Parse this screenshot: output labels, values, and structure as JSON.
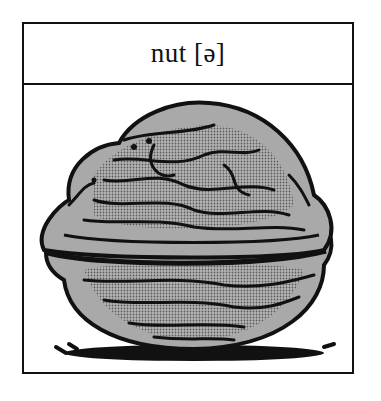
{
  "card": {
    "label": "nut [ə]",
    "word": "nut",
    "phonetic": "[ə]",
    "illustration": "walnut-illustration"
  },
  "colors": {
    "border": "#111111",
    "shell_fill": "#a9a9a9",
    "shell_dark": "#8a8a8a",
    "ink": "#111111",
    "background": "#ffffff"
  }
}
